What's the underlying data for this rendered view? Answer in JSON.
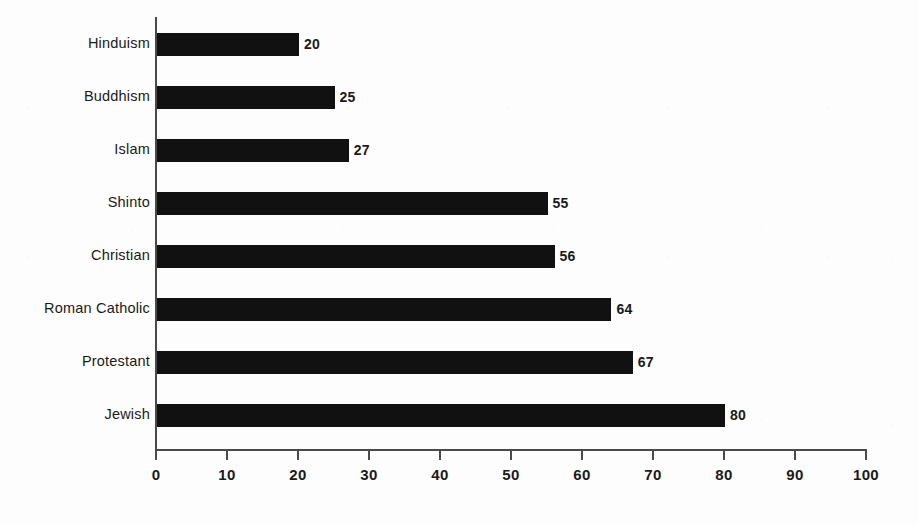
{
  "chart_data": {
    "type": "bar",
    "orientation": "horizontal",
    "title": "",
    "subtitle": "",
    "xlabel": "",
    "ylabel": "",
    "categories": [
      "Hinduism",
      "Buddhism",
      "Islam",
      "Shinto",
      "Christian",
      "Roman Catholic",
      "Protestant",
      "Jewish"
    ],
    "values": [
      20,
      25,
      27,
      55,
      56,
      64,
      67,
      80
    ],
    "value_labels": [
      "20",
      "25",
      "27",
      "55",
      "56",
      "64",
      "67",
      "80"
    ],
    "xlim": [
      0,
      100
    ],
    "xticks": [
      0,
      10,
      20,
      30,
      40,
      50,
      60,
      70,
      80,
      90,
      100
    ],
    "xtick_labels": [
      "0",
      "10",
      "20",
      "30",
      "40",
      "50",
      "60",
      "70",
      "80",
      "90",
      "100"
    ],
    "grid": false,
    "legend": null,
    "bar_color": "#111111",
    "axis_color": "#4a4a4a",
    "background_color": "#fdfdfd",
    "text_color": "#1a1a1a",
    "annotations": []
  }
}
